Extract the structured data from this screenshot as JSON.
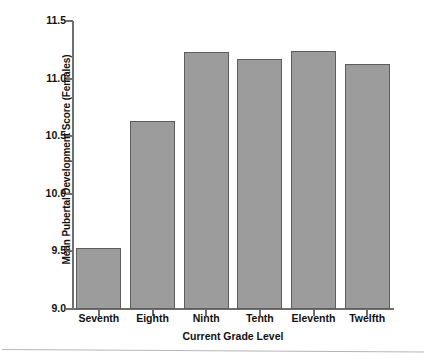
{
  "chart_data": {
    "type": "bar",
    "title": "",
    "xlabel": "Current Grade Level",
    "ylabel": "Mean Pubertal Development Score (Females)",
    "categories": [
      "Seventh",
      "Eighth",
      "Ninth",
      "Tenth",
      "Eleventh",
      "Twelfth"
    ],
    "values": [
      9.53,
      10.63,
      11.23,
      11.17,
      11.24,
      11.13
    ],
    "ylim": [
      9.0,
      11.5
    ],
    "yticks": [
      "9.0",
      "9.5",
      "10.0",
      "10.5",
      "11.0",
      "11.5"
    ],
    "ytick_values": [
      9.0,
      9.5,
      10.0,
      10.5,
      11.0,
      11.5
    ],
    "grid": false,
    "legend": null,
    "bar_color": "#9c9c9c",
    "bar_edge_color": "#5d5d5d",
    "axis_color": "#6f6f6f"
  }
}
